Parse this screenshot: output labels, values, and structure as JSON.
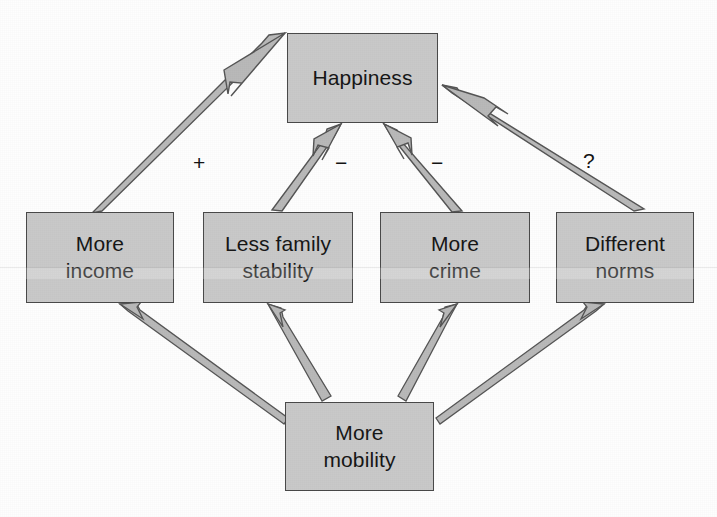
{
  "diagram": {
    "type": "causal-flow-diagram",
    "title_text": "",
    "background_color": "#fefefe",
    "node_fill_color": "#c9c9c9",
    "node_border_color": "#4a4a4a",
    "arrow_fill_color": "#b9b9b9",
    "arrow_stroke_color": "#555555",
    "nodes": [
      {
        "id": "happiness",
        "label": "Happiness",
        "x": 287,
        "y": 33,
        "width": 151,
        "height": 90
      },
      {
        "id": "more-income",
        "label": "More\nincome",
        "x": 26,
        "y": 212,
        "width": 148,
        "height": 91
      },
      {
        "id": "less-family-stability",
        "label": "Less family\nstability",
        "x": 203,
        "y": 212,
        "width": 150,
        "height": 91
      },
      {
        "id": "more-crime",
        "label": "More\ncrime",
        "x": 380,
        "y": 212,
        "width": 150,
        "height": 91
      },
      {
        "id": "different-norms",
        "label": "Different\nnorms",
        "x": 556,
        "y": 212,
        "width": 138,
        "height": 91
      },
      {
        "id": "more-mobility",
        "label": "More\nmobility",
        "x": 285,
        "y": 402,
        "width": 149,
        "height": 89
      }
    ],
    "edges": [
      {
        "id": "mobility-to-income",
        "from": "more-mobility",
        "to": "more-income",
        "sign": ""
      },
      {
        "id": "mobility-to-stability",
        "from": "more-mobility",
        "to": "less-family-stability",
        "sign": ""
      },
      {
        "id": "mobility-to-crime",
        "from": "more-mobility",
        "to": "more-crime",
        "sign": ""
      },
      {
        "id": "mobility-to-norms",
        "from": "more-mobility",
        "to": "different-norms",
        "sign": ""
      },
      {
        "id": "income-to-happiness",
        "from": "more-income",
        "to": "happiness",
        "sign": "+"
      },
      {
        "id": "stability-to-happiness",
        "from": "less-family-stability",
        "to": "happiness",
        "sign": "−"
      },
      {
        "id": "crime-to-happiness",
        "from": "more-crime",
        "to": "happiness",
        "sign": "−"
      },
      {
        "id": "norms-to-happiness",
        "from": "different-norms",
        "to": "happiness",
        "sign": "?"
      }
    ],
    "edge_signs": [
      {
        "id": "sign-income-happiness",
        "text": "+",
        "x": 193,
        "y": 152
      },
      {
        "id": "sign-stability-happiness",
        "text": "−",
        "x": 335,
        "y": 152
      },
      {
        "id": "sign-crime-happiness",
        "text": "−",
        "x": 431,
        "y": 152
      },
      {
        "id": "sign-norms-happiness",
        "text": "?",
        "x": 583,
        "y": 150
      }
    ]
  }
}
